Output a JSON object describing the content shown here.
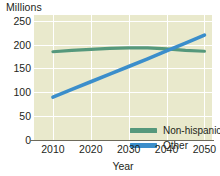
{
  "chart_data": {
    "type": "line",
    "title": "",
    "subtitle": "",
    "xlabel": "Year",
    "ylabel": "Millions",
    "x": [
      2010,
      2015,
      2020,
      2025,
      2030,
      2035,
      2040,
      2045,
      2050
    ],
    "xlim": [
      2005,
      2052
    ],
    "ylim": [
      0,
      262
    ],
    "xticks": [
      "2010",
      "2020",
      "2030",
      "2040",
      "2050"
    ],
    "xtick_values": [
      2010,
      2020,
      2030,
      2040,
      2050
    ],
    "yticks": [
      "0",
      "50",
      "100",
      "150",
      "200",
      "250"
    ],
    "ytick_values": [
      0,
      50,
      100,
      150,
      200,
      250
    ],
    "grid": "both",
    "legend_position": "inside-bottom-right",
    "series": [
      {
        "name": "Non-hispanic white",
        "color": "#55987c",
        "values": [
          185,
          188,
          190,
          192,
          193,
          193,
          191,
          188,
          186
        ]
      },
      {
        "name": "Other",
        "color": "#3b8ecb",
        "values": [
          90,
          106,
          122,
          138,
          154,
          170,
          187,
          203,
          220
        ]
      }
    ],
    "annotations": []
  },
  "legend": {
    "items": [
      {
        "label": "Non-hispanic white",
        "color": "#55987c"
      },
      {
        "label": "Other",
        "color": "#3b8ecb"
      }
    ]
  },
  "colors": {
    "plot_background": "#e9e9cc",
    "gridline": "#ffffff",
    "axis": "#6d6a5c",
    "text": "#231f1a",
    "page_background": "#ffffff"
  }
}
